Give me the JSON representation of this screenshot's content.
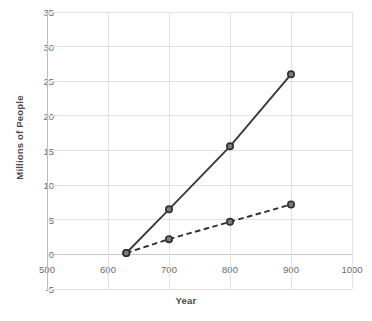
{
  "chart_data": {
    "type": "line",
    "title": "",
    "xlabel": "Year",
    "ylabel": "Millions of People",
    "xlim": [
      500,
      1000
    ],
    "ylim": [
      -5,
      35
    ],
    "grid": true,
    "legend": "none",
    "xticks": [
      "500",
      "600",
      "700",
      "800",
      "900",
      "1000"
    ],
    "xtick_values": [
      500,
      600,
      700,
      800,
      900,
      1000
    ],
    "yticks": [
      "-5",
      "0",
      "5",
      "10",
      "15",
      "20",
      "25",
      "30",
      "35"
    ],
    "ytick_values": [
      -5,
      0,
      5,
      10,
      15,
      20,
      25,
      30,
      35
    ],
    "series": [
      {
        "name": "solid-series",
        "style": "solid",
        "color": "#3a3a3a",
        "marker": "circle",
        "x": [
          630,
          700,
          800,
          900
        ],
        "values": [
          0.2,
          6.5,
          15.6,
          26.0
        ]
      },
      {
        "name": "dashed-series",
        "style": "dashed",
        "color": "#2f2f2f",
        "marker": "circle",
        "x": [
          630,
          700,
          800,
          900
        ],
        "values": [
          0.2,
          2.2,
          4.7,
          7.2
        ]
      }
    ]
  }
}
